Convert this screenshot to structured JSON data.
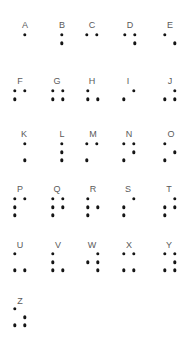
{
  "colors": {
    "dot": "#151515",
    "label": "#5a5a5a",
    "background": "#ffffff"
  },
  "chart_data": {
    "type": "diagram",
    "letters": [
      {
        "letter": "A",
        "dots": [
          1
        ]
      },
      {
        "letter": "B",
        "dots": [
          1,
          2
        ]
      },
      {
        "letter": "C",
        "dots": [
          1,
          4
        ]
      },
      {
        "letter": "D",
        "dots": [
          1,
          4,
          5
        ]
      },
      {
        "letter": "E",
        "dots": [
          1,
          5
        ]
      },
      {
        "letter": "F",
        "dots": [
          1,
          2,
          4
        ]
      },
      {
        "letter": "G",
        "dots": [
          1,
          2,
          4,
          5
        ]
      },
      {
        "letter": "H",
        "dots": [
          1,
          2,
          5
        ]
      },
      {
        "letter": "I",
        "dots": [
          2,
          4
        ]
      },
      {
        "letter": "J",
        "dots": [
          2,
          4,
          5
        ]
      },
      {
        "letter": "K",
        "dots": [
          1,
          3
        ]
      },
      {
        "letter": "L",
        "dots": [
          1,
          2,
          3
        ]
      },
      {
        "letter": "M",
        "dots": [
          1,
          3,
          4
        ]
      },
      {
        "letter": "N",
        "dots": [
          1,
          3,
          4,
          5
        ]
      },
      {
        "letter": "O",
        "dots": [
          1,
          3,
          5
        ]
      },
      {
        "letter": "P",
        "dots": [
          1,
          2,
          3,
          4
        ]
      },
      {
        "letter": "Q",
        "dots": [
          1,
          2,
          3,
          4,
          5
        ]
      },
      {
        "letter": "R",
        "dots": [
          1,
          2,
          3,
          5
        ]
      },
      {
        "letter": "S",
        "dots": [
          2,
          3,
          4
        ]
      },
      {
        "letter": "T",
        "dots": [
          2,
          3,
          4,
          5
        ]
      },
      {
        "letter": "U",
        "dots": [
          1,
          3,
          6
        ]
      },
      {
        "letter": "V",
        "dots": [
          1,
          2,
          3,
          6
        ]
      },
      {
        "letter": "W",
        "dots": [
          2,
          4,
          5,
          6
        ]
      },
      {
        "letter": "X",
        "dots": [
          1,
          3,
          4,
          6
        ]
      },
      {
        "letter": "Y",
        "dots": [
          1,
          3,
          4,
          5,
          6
        ]
      },
      {
        "letter": "Z",
        "dots": [
          1,
          3,
          5,
          6
        ]
      }
    ]
  },
  "layout": {
    "cells": [
      {
        "lx": 25,
        "ly": 25,
        "x": 25,
        "y": 35
      },
      {
        "lx": 62,
        "ly": 25,
        "x": 62,
        "y": 35
      },
      {
        "lx": 92,
        "ly": 25,
        "x": 87,
        "y": 35
      },
      {
        "lx": 130,
        "ly": 25,
        "x": 125,
        "y": 35
      },
      {
        "lx": 170,
        "ly": 25,
        "x": 165,
        "y": 35
      },
      {
        "lx": 20,
        "ly": 81,
        "x": 15,
        "y": 91
      },
      {
        "lx": 57,
        "ly": 81,
        "x": 53,
        "y": 91
      },
      {
        "lx": 92,
        "ly": 81,
        "x": 88,
        "y": 91
      },
      {
        "lx": 128,
        "ly": 81,
        "x": 124,
        "y": 91
      },
      {
        "lx": 170,
        "ly": 81,
        "x": 165,
        "y": 91
      },
      {
        "lx": 24,
        "ly": 134,
        "x": 25,
        "y": 144
      },
      {
        "lx": 62,
        "ly": 134,
        "x": 62,
        "y": 144
      },
      {
        "lx": 93,
        "ly": 134,
        "x": 87,
        "y": 144
      },
      {
        "lx": 129,
        "ly": 134,
        "x": 124,
        "y": 144
      },
      {
        "lx": 171,
        "ly": 134,
        "x": 165,
        "y": 144
      },
      {
        "lx": 20,
        "ly": 189,
        "x": 15,
        "y": 199
      },
      {
        "lx": 57,
        "ly": 189,
        "x": 53,
        "y": 199
      },
      {
        "lx": 93,
        "ly": 189,
        "x": 88,
        "y": 199
      },
      {
        "lx": 128,
        "ly": 189,
        "x": 124,
        "y": 199
      },
      {
        "lx": 169,
        "ly": 189,
        "x": 165,
        "y": 199
      },
      {
        "lx": 20,
        "ly": 245,
        "x": 15,
        "y": 254
      },
      {
        "lx": 58,
        "ly": 245,
        "x": 53,
        "y": 254
      },
      {
        "lx": 92,
        "ly": 245,
        "x": 88,
        "y": 254
      },
      {
        "lx": 129,
        "ly": 245,
        "x": 124,
        "y": 254
      },
      {
        "lx": 169,
        "ly": 245,
        "x": 165,
        "y": 254
      },
      {
        "lx": 20,
        "ly": 301,
        "x": 15,
        "y": 309
      }
    ],
    "dx": 10,
    "dy": 8.2
  }
}
